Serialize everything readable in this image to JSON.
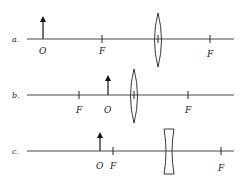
{
  "diagram": {
    "rows": [
      {
        "id": "a",
        "label": "a.",
        "axis_y": 39,
        "axis_x1": 27,
        "axis_x2": 234,
        "lens_type": "convex",
        "lens_x": 158,
        "lens_top": 13,
        "lens_bottom": 67,
        "object": {
          "label": "O",
          "x": 43,
          "top": 17
        },
        "focal_points": [
          {
            "label": "F",
            "x": 102
          },
          {
            "label": "F",
            "x": 210
          }
        ]
      },
      {
        "id": "b",
        "label": "b.",
        "axis_y": 95,
        "axis_x1": 27,
        "axis_x2": 234,
        "lens_type": "convex",
        "lens_x": 134,
        "lens_top": 69,
        "lens_bottom": 123,
        "object": {
          "label": "O",
          "x": 108,
          "top": 76
        },
        "focal_points": [
          {
            "label": "F",
            "x": 79
          },
          {
            "label": "F",
            "x": 188
          }
        ]
      },
      {
        "id": "c",
        "label": "c.",
        "axis_y": 151,
        "axis_x1": 27,
        "axis_x2": 234,
        "lens_type": "concave",
        "lens_x": 169,
        "lens_top": 129,
        "lens_bottom": 174,
        "object": {
          "label": "O",
          "x": 100,
          "top": 133
        },
        "focal_points": [
          {
            "label": "F",
            "x": 113
          },
          {
            "label": "F",
            "x": 221
          }
        ]
      }
    ]
  }
}
